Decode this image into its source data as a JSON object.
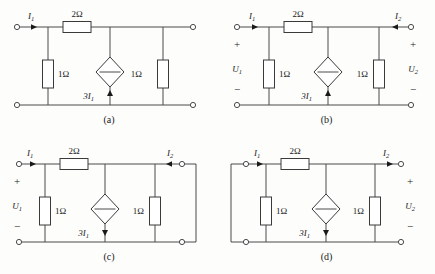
{
  "figure": {
    "background": "#fdfdfc",
    "line_color": "#4a4a4a",
    "text_color": "#1a1a1a"
  },
  "labels": {
    "r_series": "2Ω",
    "r_left": "1Ω",
    "r_right": "1Ω",
    "source": "3I",
    "source_sub": "1",
    "i1": "I",
    "i1_sub": "1",
    "i2": "I",
    "i2_sub": "2",
    "u1": "U",
    "u1_sub": "1",
    "u2": "U",
    "u2_sub": "2",
    "plus": "+",
    "minus": "−"
  },
  "panels": [
    {
      "id": "a",
      "caption": "(a)",
      "show_i1": true,
      "show_i2": false,
      "show_u1": false,
      "show_u2": false,
      "i1_direction": "right",
      "i2_direction": "none",
      "source_arrow": "up",
      "short_side": "none",
      "r_series": "2Ω",
      "r_left": "1Ω",
      "r_right": "1Ω",
      "source": "3I1"
    },
    {
      "id": "b",
      "caption": "(b)",
      "show_i1": true,
      "show_i2": true,
      "show_u1": true,
      "show_u2": true,
      "i1_direction": "right",
      "i2_direction": "left",
      "source_arrow": "up",
      "short_side": "none",
      "r_series": "2Ω",
      "r_left": "1Ω",
      "r_right": "1Ω",
      "source": "3I1"
    },
    {
      "id": "c",
      "caption": "(c)",
      "show_i1": true,
      "show_i2": true,
      "show_u1": true,
      "show_u2": false,
      "i1_direction": "right",
      "i2_direction": "left",
      "source_arrow": "down",
      "short_side": "right",
      "r_series": "2Ω",
      "r_left": "1Ω",
      "r_right": "1Ω",
      "source": "3I1"
    },
    {
      "id": "d",
      "caption": "(d)",
      "show_i1": true,
      "show_i2": true,
      "show_u1": false,
      "show_u2": true,
      "i1_direction": "right",
      "i2_direction": "right",
      "source_arrow": "down",
      "short_side": "left",
      "r_series": "2Ω",
      "r_left": "1Ω",
      "r_right": "1Ω",
      "source": "3I1"
    }
  ]
}
